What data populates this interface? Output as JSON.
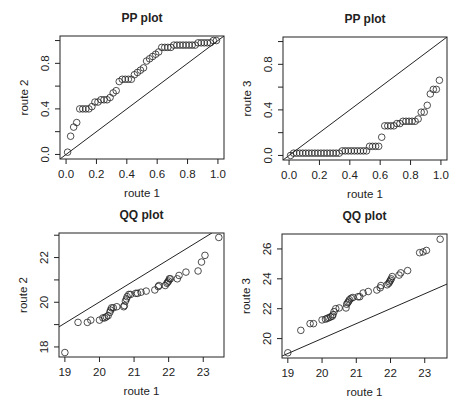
{
  "figure": {
    "background": "#ffffff",
    "ink": "#222222"
  },
  "chart_data": [
    {
      "id": "pp12",
      "type": "scatter",
      "title": "PP plot",
      "xlabel": "route 1",
      "ylabel": "route 2",
      "xlim": [
        -0.04,
        1.04
      ],
      "ylim": [
        -0.04,
        1.04
      ],
      "xticks": [
        0.0,
        0.2,
        0.4,
        0.6,
        0.8,
        1.0
      ],
      "xtick_labels": [
        "0.0",
        "0.2",
        "0.4",
        "0.6",
        "0.8",
        "1.0"
      ],
      "yticks": [
        0.0,
        0.2,
        0.4,
        0.6,
        0.8,
        1.0
      ],
      "ytick_labels": [
        "0.0",
        "",
        "0.4",
        "",
        "0.8",
        ""
      ],
      "reference_line": {
        "x1": -0.04,
        "y1": -0.04,
        "x2": 1.04,
        "y2": 1.04
      },
      "box": {
        "left": 60,
        "top": 36,
        "right": 224,
        "bottom": 159
      },
      "x": [
        0.01,
        0.03,
        0.05,
        0.07,
        0.09,
        0.11,
        0.13,
        0.15,
        0.17,
        0.19,
        0.21,
        0.23,
        0.25,
        0.27,
        0.29,
        0.31,
        0.33,
        0.35,
        0.37,
        0.39,
        0.41,
        0.43,
        0.45,
        0.47,
        0.49,
        0.51,
        0.53,
        0.55,
        0.57,
        0.59,
        0.61,
        0.63,
        0.65,
        0.67,
        0.69,
        0.71,
        0.73,
        0.75,
        0.77,
        0.79,
        0.81,
        0.83,
        0.85,
        0.87,
        0.89,
        0.91,
        0.93,
        0.95,
        0.97,
        0.99
      ],
      "y": [
        0.02,
        0.16,
        0.24,
        0.28,
        0.4,
        0.4,
        0.4,
        0.4,
        0.42,
        0.46,
        0.46,
        0.48,
        0.48,
        0.48,
        0.5,
        0.54,
        0.56,
        0.64,
        0.66,
        0.66,
        0.66,
        0.66,
        0.7,
        0.72,
        0.74,
        0.76,
        0.82,
        0.84,
        0.86,
        0.88,
        0.9,
        0.94,
        0.94,
        0.94,
        0.94,
        0.96,
        0.96,
        0.96,
        0.96,
        0.96,
        0.96,
        0.96,
        0.96,
        0.98,
        0.98,
        0.98,
        0.98,
        0.98,
        1.0,
        1.0
      ]
    },
    {
      "id": "pp13",
      "type": "scatter",
      "title": "PP plot",
      "xlabel": "route 1",
      "ylabel": "route 3",
      "xlim": [
        -0.04,
        1.04
      ],
      "ylim": [
        -0.04,
        1.04
      ],
      "xticks": [
        0.0,
        0.2,
        0.4,
        0.6,
        0.8,
        1.0
      ],
      "xtick_labels": [
        "0.0",
        "0.2",
        "0.4",
        "0.6",
        "0.8",
        "1.0"
      ],
      "yticks": [
        0.0,
        0.2,
        0.4,
        0.6,
        0.8,
        1.0
      ],
      "ytick_labels": [
        "0.0",
        "",
        "0.4",
        "",
        "0.8",
        ""
      ],
      "reference_line": {
        "x1": -0.04,
        "y1": -0.04,
        "x2": 1.04,
        "y2": 1.04
      },
      "box": {
        "left": 283,
        "top": 37,
        "right": 447,
        "bottom": 160
      },
      "x": [
        0.01,
        0.03,
        0.05,
        0.07,
        0.09,
        0.11,
        0.13,
        0.15,
        0.17,
        0.19,
        0.21,
        0.23,
        0.25,
        0.27,
        0.29,
        0.31,
        0.33,
        0.35,
        0.37,
        0.39,
        0.41,
        0.43,
        0.45,
        0.47,
        0.49,
        0.51,
        0.53,
        0.55,
        0.57,
        0.59,
        0.61,
        0.63,
        0.65,
        0.67,
        0.69,
        0.71,
        0.73,
        0.75,
        0.77,
        0.79,
        0.81,
        0.83,
        0.85,
        0.87,
        0.89,
        0.91,
        0.93,
        0.95,
        0.97,
        0.99
      ],
      "y": [
        0.0,
        0.02,
        0.02,
        0.02,
        0.02,
        0.02,
        0.02,
        0.02,
        0.02,
        0.02,
        0.02,
        0.02,
        0.02,
        0.02,
        0.02,
        0.02,
        0.02,
        0.04,
        0.04,
        0.04,
        0.04,
        0.04,
        0.04,
        0.04,
        0.04,
        0.04,
        0.08,
        0.08,
        0.08,
        0.08,
        0.16,
        0.26,
        0.26,
        0.26,
        0.26,
        0.28,
        0.28,
        0.3,
        0.3,
        0.3,
        0.3,
        0.3,
        0.32,
        0.38,
        0.38,
        0.44,
        0.54,
        0.58,
        0.58,
        0.66
      ]
    },
    {
      "id": "qq12",
      "type": "scatter",
      "title": "QQ plot",
      "xlabel": "route 1",
      "ylabel": "route 2",
      "xlim": [
        18.83,
        23.6
      ],
      "ylim": [
        17.55,
        23.1
      ],
      "xticks": [
        19,
        20,
        21,
        22,
        23
      ],
      "xtick_labels": [
        "19",
        "20",
        "21",
        "22",
        "23"
      ],
      "yticks": [
        18,
        19,
        20,
        21,
        22,
        23
      ],
      "ytick_labels": [
        "18",
        "",
        "20",
        "",
        "22",
        ""
      ],
      "reference_line": {
        "x1": 18.83,
        "y1": 18.9,
        "x2": 23.25,
        "y2": 23.1
      },
      "box": {
        "left": 59,
        "top": 233,
        "right": 224,
        "bottom": 357
      },
      "x": [
        19.0,
        19.38,
        19.65,
        19.75,
        20.0,
        20.1,
        20.15,
        20.2,
        20.25,
        20.3,
        20.32,
        20.35,
        20.4,
        20.5,
        20.7,
        20.72,
        20.75,
        20.78,
        20.8,
        20.85,
        20.9,
        21.05,
        21.1,
        21.2,
        21.35,
        21.6,
        21.7,
        21.72,
        21.9,
        21.95,
        21.97,
        22.0,
        22.02,
        22.05,
        22.25,
        22.3,
        22.5,
        22.85,
        22.95,
        23.05,
        23.45
      ],
      "y": [
        17.75,
        19.1,
        19.1,
        19.2,
        19.2,
        19.3,
        19.3,
        19.35,
        19.4,
        19.55,
        19.65,
        19.75,
        19.75,
        19.8,
        19.8,
        19.85,
        20.05,
        20.15,
        20.25,
        20.35,
        20.35,
        20.4,
        20.4,
        20.45,
        20.5,
        20.55,
        20.7,
        20.75,
        20.75,
        20.85,
        20.9,
        20.95,
        21.05,
        21.05,
        21.05,
        21.2,
        21.35,
        21.4,
        21.8,
        22.1,
        22.9
      ]
    },
    {
      "id": "qq13",
      "type": "scatter",
      "title": "QQ plot",
      "xlabel": "route 1",
      "ylabel": "route 3",
      "xlim": [
        18.83,
        23.65
      ],
      "ylim": [
        18.7,
        27.0
      ],
      "xticks": [
        19,
        20,
        21,
        22,
        23
      ],
      "xtick_labels": [
        "19",
        "20",
        "21",
        "22",
        "23"
      ],
      "yticks": [
        20,
        22,
        24,
        26
      ],
      "ytick_labels": [
        "20",
        "22",
        "24",
        "26"
      ],
      "reference_line": {
        "x1": 18.83,
        "y1": 18.83,
        "x2": 23.65,
        "y2": 23.65
      },
      "box": {
        "left": 282,
        "top": 234,
        "right": 447,
        "bottom": 358
      },
      "x": [
        19.0,
        19.38,
        19.65,
        19.75,
        20.0,
        20.1,
        20.15,
        20.2,
        20.25,
        20.3,
        20.32,
        20.35,
        20.4,
        20.5,
        20.7,
        20.72,
        20.75,
        20.78,
        20.8,
        20.85,
        20.9,
        21.05,
        21.1,
        21.2,
        21.35,
        21.6,
        21.7,
        21.72,
        21.9,
        21.95,
        21.97,
        22.0,
        22.02,
        22.05,
        22.25,
        22.3,
        22.5,
        22.85,
        22.95,
        23.05,
        23.45
      ],
      "y": [
        19.05,
        20.55,
        21.0,
        21.0,
        21.25,
        21.3,
        21.35,
        21.4,
        21.45,
        21.5,
        21.6,
        21.8,
        22.0,
        22.05,
        22.05,
        22.3,
        22.4,
        22.5,
        22.6,
        22.7,
        22.75,
        22.8,
        22.8,
        23.05,
        23.15,
        23.25,
        23.4,
        23.55,
        23.6,
        23.7,
        23.8,
        23.9,
        24.0,
        24.15,
        24.25,
        24.4,
        24.55,
        25.75,
        25.8,
        25.9,
        26.65
      ]
    }
  ]
}
